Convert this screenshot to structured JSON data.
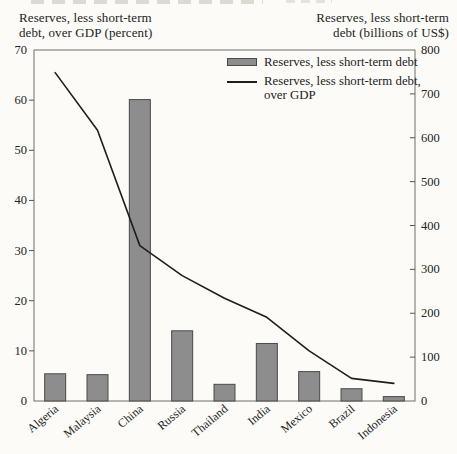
{
  "titles": {
    "left_line1": "Reserves, less short-term",
    "left_line2": "debt, over GDP (percent)",
    "right_line1": "Reserves, less short-term",
    "right_line2": "debt (billions of US$)"
  },
  "chart_data": {
    "type": "bar",
    "subtype": "bar-and-line-dual-axis",
    "categories": [
      "Algeria",
      "Malaysia",
      "China",
      "Russia",
      "Thailand",
      "India",
      "Mexico",
      "Brazil",
      "Indonesia"
    ],
    "series": [
      {
        "name": "Reserves, less short-term debt",
        "type": "bar",
        "axis": "right",
        "unit": "billions of US$",
        "values": [
          62,
          60,
          687,
          160,
          38,
          131,
          67,
          28,
          10
        ]
      },
      {
        "name": "Reserves, less short-term debt, over GDP",
        "type": "line",
        "axis": "left",
        "unit": "percent",
        "values": [
          65.5,
          54,
          31,
          25,
          20.5,
          16.7,
          10,
          4.5,
          3.5
        ]
      }
    ],
    "left_axis": {
      "label": "Reserves, less short-term debt, over GDP (percent)",
      "min": 0,
      "max": 70,
      "step": 10,
      "ticks": [
        0,
        10,
        20,
        30,
        40,
        50,
        60,
        70
      ]
    },
    "right_axis": {
      "label": "Reserves, less short-term debt (billions of US$)",
      "min": 0,
      "max": 800,
      "step": 100,
      "ticks": [
        0,
        100,
        200,
        300,
        400,
        500,
        600,
        700,
        800
      ]
    },
    "legend": [
      "Reserves, less short-term debt",
      "Reserves, less short-term debt, over GDP"
    ],
    "legend_position": "top-right-inside",
    "grid": false
  },
  "colors": {
    "background": "#fcfbf8",
    "bar_fill": "#8d8d8d",
    "bar_border": "#4a4a4a",
    "line": "#1e1e1e",
    "plot_border": "#6e6e6e",
    "tick": "#555555",
    "text": "#232323"
  }
}
